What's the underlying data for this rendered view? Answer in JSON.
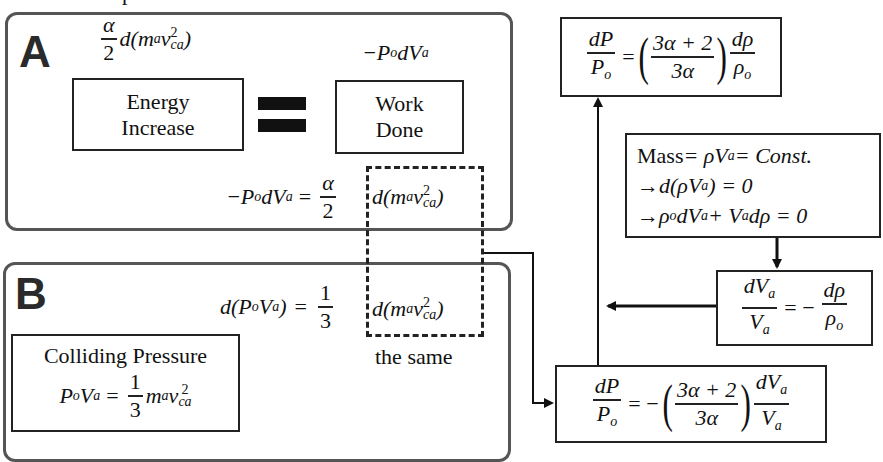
{
  "header": {
    "partial_caption": "…p… …ate…"
  },
  "panel_a": {
    "letter": "A",
    "energy_label": {
      "line1": "Energy",
      "line2": "Increase"
    },
    "work_label": {
      "line1": "Work",
      "line2": "Done"
    },
    "energy_expr": {
      "frac_num": "α",
      "frac_den": "2",
      "rest": "d(m",
      "sub_a": "a",
      "v": "v",
      "sup2": "2",
      "sub_ca": "ca",
      "close": ")"
    },
    "work_expr": {
      "text": "−P",
      "sub_o": "o",
      "mid": "dV",
      "sub_a": "a"
    },
    "equation": {
      "lhs": "−P",
      "lhs_sub_o": "o",
      "lhs_mid": "dV",
      "lhs_sub_a": "a",
      "eq": "=",
      "frac_num": "α",
      "frac_den": "2"
    },
    "shared_term": {
      "text": "d(m",
      "sub_a": "a",
      "v": "v",
      "sup2": "2",
      "sub_ca": "ca",
      "close": ")"
    }
  },
  "panel_b": {
    "letter": "B",
    "equation": {
      "lhs": "d(P",
      "sub_o": "o",
      "mid": "V",
      "sub_a": "a",
      "close": ")",
      "eq": "=",
      "frac_num": "1",
      "frac_den": "3"
    },
    "shared_term": {
      "text": "d(m",
      "sub_a": "a",
      "v": "v",
      "sup2": "2",
      "sub_ca": "ca",
      "close": ")"
    },
    "same_label": "the same",
    "colliding_box": {
      "title": "Colliding Pressure",
      "lhs": "P",
      "sub_o": "o",
      "mid": "V",
      "sub_a": "a",
      "eq": "=",
      "frac_num": "1",
      "frac_den": "3",
      "rhs": "m",
      "rhs_sub_a": "a",
      "v": "v",
      "sup2": "2",
      "sub_ca": "ca"
    }
  },
  "right": {
    "top_box": {
      "lhs_num": "dP",
      "lhs_den": "P",
      "lhs_den_sub": "o",
      "eq": "=",
      "paren_num": "3α + 2",
      "paren_den": "3α",
      "rhs_num": "dρ",
      "rhs_den": "ρ",
      "rhs_den_sub": "o"
    },
    "mass_box": {
      "line1": {
        "label": "Mass",
        "eq": " = ρV",
        "sub_a": "a",
        "rest": " = Const."
      },
      "line2": {
        "arrow": "→",
        "text": " d(ρV",
        "sub_a": "a",
        "rest": ") = 0"
      },
      "line3": {
        "arrow": "→",
        "text": " ρ",
        "sub_o": "o",
        "mid": "dV",
        "sub_a": "a",
        "mid2": " + V",
        "sub_a2": "a",
        "rest": "dρ = 0"
      }
    },
    "dva_box": {
      "lhs_num": "dV",
      "lhs_num_sub": "a",
      "lhs_den": "V",
      "lhs_den_sub": "a",
      "eq": "= −",
      "rhs_num": "dρ",
      "rhs_den": "ρ",
      "rhs_den_sub": "o"
    },
    "bottom_box": {
      "lhs_num": "dP",
      "lhs_den": "P",
      "lhs_den_sub": "o",
      "eq": "= −",
      "paren_num": "3α + 2",
      "paren_den": "3α",
      "rhs_num": "dV",
      "rhs_num_sub": "a",
      "rhs_den": "V",
      "rhs_den_sub": "a"
    }
  },
  "colors": {
    "panel_border": "#555555",
    "box_border": "#222222",
    "ink": "#111111",
    "background": "#ffffff"
  }
}
